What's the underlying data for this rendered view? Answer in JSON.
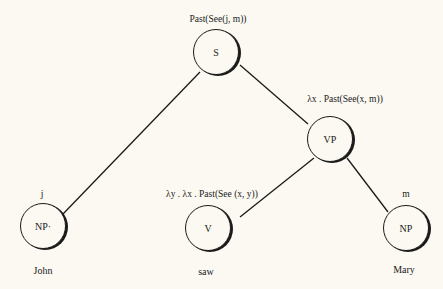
{
  "diagram": {
    "type": "syntax-tree",
    "nodes": {
      "s": {
        "label": "S",
        "semantics": "Past(See(j, m))"
      },
      "vp": {
        "label": "VP",
        "semantics": "λx . Past(See(x, m))"
      },
      "np1": {
        "label": "NP·",
        "semantics": "j",
        "word": "John"
      },
      "v": {
        "label": "V",
        "semantics": "λy . λx . Past(See (x, y))",
        "word": "saw"
      },
      "np2": {
        "label": "NP",
        "semantics": "m",
        "word": "Mary"
      }
    },
    "edges": [
      [
        "S",
        "NP"
      ],
      [
        "S",
        "VP"
      ],
      [
        "VP",
        "V"
      ],
      [
        "VP",
        "NP"
      ]
    ]
  }
}
